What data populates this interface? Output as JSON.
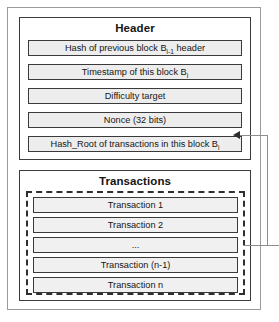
{
  "diagram": {
    "title_header": "Header",
    "title_transactions": "Transactions",
    "header_fields": [
      {
        "id": "prev-hash",
        "text_before": "Hash of previous block B",
        "sub": "i-1",
        "text_after": " header"
      },
      {
        "id": "timestamp",
        "text_before": "Timestamp of this block B",
        "sub": "i",
        "text_after": ""
      },
      {
        "id": "difficulty",
        "text_before": "Difficulty target",
        "sub": "",
        "text_after": ""
      },
      {
        "id": "nonce",
        "text_before": "Nonce (32 bits)",
        "sub": "",
        "text_after": ""
      },
      {
        "id": "hash-root",
        "text_before": "Hash_Root of transactions in this block B",
        "sub": "i",
        "text_after": ""
      }
    ],
    "header_field_labels": [
      "Hash of previous block Bi-1 header",
      "Timestamp of this block Bi",
      "Difficulty target",
      "Nonce (32 bits)",
      "Hash_Root of transactions in this block Bi"
    ],
    "transactions": [
      "Transaction 1",
      "Transaction 2",
      "...",
      "Transaction (n-1)",
      "Transaction n"
    ],
    "colors": {
      "field_fill": "#ededed",
      "tx_fill": "#f0f0f0",
      "border": "#3a3a3a",
      "outer_border": "#9a9a9a",
      "connector": "#8d8d8d",
      "text": "#151515"
    }
  }
}
